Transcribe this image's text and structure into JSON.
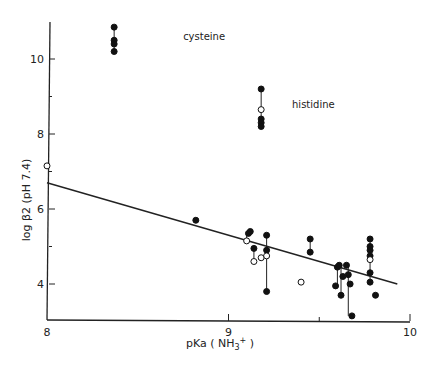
{
  "chart_data": {
    "type": "scatter",
    "title": "",
    "xlabel": "pKa ( NH3+ )",
    "ylabel": "log β2 (pH 7.4)",
    "xlim": [
      8,
      10
    ],
    "ylim": [
      3,
      11
    ],
    "x_ticks": [
      8,
      9,
      10
    ],
    "y_ticks": [
      4,
      6,
      8,
      10
    ],
    "grid": false,
    "annotations": [
      {
        "text": "cysteine",
        "x": 8.75,
        "y": 10.5
      },
      {
        "text": "histidine",
        "x": 9.35,
        "y": 8.7
      }
    ],
    "regression_line": {
      "x": [
        8.0,
        9.93
      ],
      "y": [
        6.7,
        4.0
      ]
    },
    "series": [
      {
        "name": "filled",
        "marker": "filled-circle",
        "points": [
          [
            8.37,
            10.85
          ],
          [
            8.37,
            10.5
          ],
          [
            8.37,
            10.4
          ],
          [
            8.37,
            10.2
          ],
          [
            9.18,
            9.2
          ],
          [
            9.18,
            8.4
          ],
          [
            9.18,
            8.3
          ],
          [
            9.18,
            8.2
          ],
          [
            8.82,
            5.7
          ],
          [
            9.11,
            5.35
          ],
          [
            9.12,
            5.4
          ],
          [
            9.14,
            4.95
          ],
          [
            9.21,
            5.3
          ],
          [
            9.21,
            4.9
          ],
          [
            9.21,
            3.8
          ],
          [
            9.45,
            5.2
          ],
          [
            9.45,
            4.85
          ],
          [
            9.6,
            4.45
          ],
          [
            9.61,
            4.5
          ],
          [
            9.59,
            3.95
          ],
          [
            9.62,
            3.7
          ],
          [
            9.63,
            4.2
          ],
          [
            9.65,
            4.5
          ],
          [
            9.66,
            4.25
          ],
          [
            9.67,
            4.0
          ],
          [
            9.68,
            3.15
          ],
          [
            9.78,
            5.2
          ],
          [
            9.78,
            5.0
          ],
          [
            9.78,
            4.9
          ],
          [
            9.78,
            4.75
          ],
          [
            9.78,
            4.3
          ],
          [
            9.78,
            4.05
          ],
          [
            9.81,
            3.7
          ]
        ]
      },
      {
        "name": "open",
        "marker": "open-circle",
        "points": [
          [
            8.0,
            7.15
          ],
          [
            9.18,
            8.65
          ],
          [
            9.1,
            5.15
          ],
          [
            9.14,
            4.6
          ],
          [
            9.18,
            4.7
          ],
          [
            9.21,
            4.75
          ],
          [
            9.4,
            4.05
          ],
          [
            9.78,
            4.65
          ]
        ]
      }
    ],
    "drop_lines": [
      [
        [
          8.37,
          10.85
        ],
        [
          8.37,
          10.2
        ]
      ],
      [
        [
          9.18,
          9.2
        ],
        [
          9.18,
          8.2
        ]
      ],
      [
        [
          9.1,
          5.35
        ],
        [
          9.1,
          5.15
        ]
      ],
      [
        [
          9.14,
          4.95
        ],
        [
          9.14,
          4.6
        ]
      ],
      [
        [
          9.21,
          5.3
        ],
        [
          9.21,
          3.8
        ]
      ],
      [
        [
          9.45,
          5.2
        ],
        [
          9.45,
          4.85
        ]
      ],
      [
        [
          9.6,
          4.45
        ],
        [
          9.6,
          3.95
        ]
      ],
      [
        [
          9.62,
          4.5
        ],
        [
          9.62,
          3.7
        ]
      ],
      [
        [
          9.66,
          4.5
        ],
        [
          9.66,
          3.15
        ]
      ],
      [
        [
          9.78,
          5.2
        ],
        [
          9.78,
          4.05
        ]
      ]
    ]
  }
}
